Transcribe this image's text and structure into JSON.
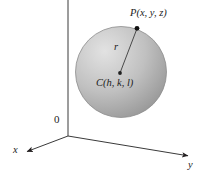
{
  "figure": {
    "background_color": "#ffffff",
    "ink_color": "#231f20",
    "sphere": {
      "fill_light": "#d6d6d6",
      "fill_mid": "#b4b4b4",
      "fill_dark": "#9a9a9a",
      "edge_color": "#8c8c8c",
      "center_px": {
        "x": 121,
        "y": 72
      },
      "radius_px": 46
    },
    "labels": {
      "point_p": "P(x, y, z)",
      "radius": "r",
      "center": "C(h, k, l)",
      "origin": "0",
      "axis_x": "x",
      "axis_y": "y"
    },
    "points": {
      "p_dot": {
        "x": 137,
        "y": 28
      },
      "c_dot": {
        "x": 120,
        "y": 73
      },
      "origin": {
        "x": 68,
        "y": 136
      }
    },
    "axes": [
      {
        "name": "z-axis",
        "from": {
          "x": 68,
          "y": 0
        },
        "to": {
          "x": 68,
          "y": 136
        },
        "arrow": false
      },
      {
        "name": "x-axis",
        "from": {
          "x": 68,
          "y": 136
        },
        "to": {
          "x": 25,
          "y": 152
        },
        "arrow": true
      },
      {
        "name": "y-axis",
        "from": {
          "x": 68,
          "y": 136
        },
        "to": {
          "x": 191,
          "y": 156
        },
        "arrow": true
      }
    ],
    "radius_segment": {
      "from": {
        "x": 120,
        "y": 73
      },
      "to": {
        "x": 137,
        "y": 28
      }
    }
  }
}
